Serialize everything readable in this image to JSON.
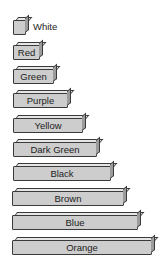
{
  "diagram": {
    "rods": [
      {
        "label": "White",
        "length": 1,
        "label_outside": true
      },
      {
        "label": "Red",
        "length": 2
      },
      {
        "label": "Green",
        "length": 3
      },
      {
        "label": "Purple",
        "length": 4
      },
      {
        "label": "Yellow",
        "length": 5
      },
      {
        "label": "Dark Green",
        "length": 6
      },
      {
        "label": "Black",
        "length": 7
      },
      {
        "label": "Brown",
        "length": 8
      },
      {
        "label": "Blue",
        "length": 9
      },
      {
        "label": "Orange",
        "length": 10
      }
    ]
  }
}
